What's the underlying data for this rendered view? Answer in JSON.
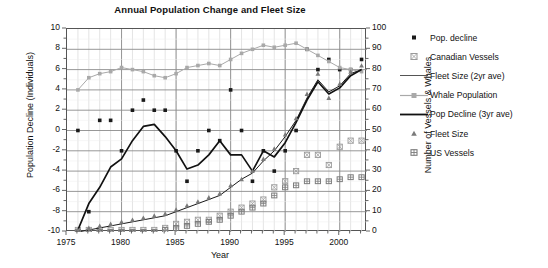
{
  "chart_data": {
    "type": "line",
    "title": "Annual Population Change and Fleet Size",
    "xlabel": "Year",
    "ylabel": "Population Decline (Individuals)",
    "y2label": "Number of Vessels & Whales",
    "xlim": [
      1975,
      2002.5
    ],
    "ylim": [
      -10,
      10
    ],
    "y2lim": [
      0,
      100
    ],
    "xticks": [
      "1975",
      "1980",
      "1985",
      "1990",
      "1995",
      "2000"
    ],
    "xtick_values": [
      1975,
      1980,
      1985,
      1990,
      1995,
      2000
    ],
    "yticks": [
      "10",
      "8",
      "6",
      "4",
      "2",
      "0",
      "-2",
      "-4",
      "-6",
      "-8",
      "-10"
    ],
    "ytick_values": [
      10,
      8,
      6,
      4,
      2,
      0,
      -2,
      -4,
      -6,
      -8,
      -10
    ],
    "y2ticks": [
      "100",
      "90",
      "80",
      "70",
      "60",
      "50",
      "40",
      "30",
      "20",
      "10",
      "0"
    ],
    "y2tick_values": [
      100,
      90,
      80,
      70,
      60,
      50,
      40,
      30,
      20,
      10,
      0
    ],
    "grid": true,
    "legend_position": "right",
    "x": [
      1976,
      1977,
      1978,
      1979,
      1980,
      1981,
      1982,
      1983,
      1984,
      1985,
      1986,
      1987,
      1988,
      1989,
      1990,
      1991,
      1992,
      1993,
      1994,
      1995,
      1996,
      1997,
      1998,
      1999,
      2000,
      2001,
      2002
    ],
    "series": [
      {
        "name": "Pop. decline",
        "axis": "left",
        "style": "scatter",
        "marker": "square-filled",
        "color": "#1a1a1a",
        "values": [
          0,
          -8,
          1,
          1,
          -2,
          2,
          3,
          2,
          2,
          -2,
          -5,
          -2,
          0,
          -1,
          4,
          0,
          -5,
          -2,
          -4,
          -2,
          0,
          8,
          6,
          7,
          6,
          6,
          7
        ]
      },
      {
        "name": "Canadian Vessels",
        "axis": "right",
        "style": "scatter",
        "marker": "square-crossed",
        "color": "#9a9a9a",
        "values": [
          1,
          1,
          1,
          1,
          1,
          1,
          1,
          1,
          2,
          4,
          5,
          6,
          6,
          8,
          10,
          12,
          14,
          16,
          22,
          25,
          30,
          38,
          38,
          33,
          42,
          45,
          45
        ]
      },
      {
        "name": "Fleet Size (2yr ave)",
        "axis": "right",
        "style": "line-thin",
        "color": "#1a1a1a",
        "values": [
          0,
          1,
          2,
          3,
          4,
          5,
          6,
          7,
          8,
          10,
          12,
          14,
          16,
          18,
          22,
          26,
          29,
          35,
          40,
          47,
          55,
          66,
          75,
          69,
          72,
          78,
          80
        ]
      },
      {
        "name": "Whale Population",
        "axis": "right",
        "style": "line-marker",
        "marker": "square-filled",
        "color": "#a9a9a9",
        "values": [
          70,
          76,
          78,
          79,
          81,
          80,
          79,
          77,
          76,
          78,
          81,
          82,
          83,
          82,
          85,
          88,
          90,
          92,
          91,
          92,
          93,
          90,
          87,
          84,
          81,
          80,
          79
        ]
      },
      {
        "name": "Pop Decline (3yr ave)",
        "axis": "right",
        "style": "line-thick",
        "color": "#111111",
        "values": [
          1,
          14,
          22,
          32,
          36,
          45,
          52,
          53,
          47,
          40,
          31,
          33,
          38,
          45,
          38,
          38,
          30,
          40,
          37,
          44,
          54,
          65,
          74,
          68,
          71,
          77,
          80
        ]
      },
      {
        "name": "Fleet Size",
        "axis": "right",
        "style": "scatter",
        "marker": "triangle",
        "color": "#7a7a7a",
        "values": [
          1,
          2,
          3,
          4,
          5,
          6,
          7,
          8,
          9,
          11,
          13,
          15,
          17,
          19,
          23,
          26,
          30,
          36,
          41,
          48,
          56,
          68,
          78,
          66,
          73,
          79,
          82
        ]
      },
      {
        "name": "US Vessels",
        "axis": "right",
        "style": "scatter",
        "marker": "square-grid",
        "color": "#7d7d7d",
        "values": [
          0,
          0,
          0,
          0,
          0,
          0,
          0,
          0,
          1,
          2,
          3,
          4,
          5,
          6,
          8,
          10,
          12,
          14,
          18,
          22,
          23,
          25,
          25,
          25,
          26,
          27,
          27
        ]
      }
    ]
  },
  "legend": {
    "items": [
      {
        "label": "Pop. decline",
        "marker": "square-filled",
        "color": "#1a1a1a"
      },
      {
        "label": "Canadian Vessels",
        "marker": "square-crossed",
        "color": "#9a9a9a"
      },
      {
        "label": "Fleet Size (2yr ave)",
        "marker": "line-thin",
        "color": "#555555"
      },
      {
        "label": "Whale Population",
        "marker": "line-marker",
        "color": "#a9a9a9"
      },
      {
        "label": "Pop Decline (3yr ave)",
        "marker": "line-thick",
        "color": "#111111"
      },
      {
        "label": "Fleet Size",
        "marker": "triangle",
        "color": "#7a7a7a"
      },
      {
        "label": "US Vessels",
        "marker": "square-grid",
        "color": "#7d7d7d"
      }
    ]
  },
  "colors": {
    "axis": "#555555",
    "grid_major": "#8c8c8c",
    "grid_minor": "#d8d8d8",
    "background": "#ffffff",
    "text": "#111111"
  }
}
